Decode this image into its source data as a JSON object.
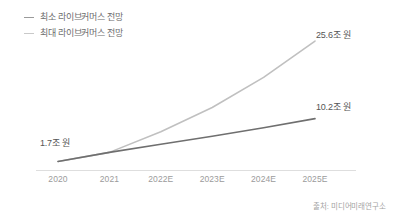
{
  "legend": {
    "position": "top-left",
    "items": [
      {
        "label": "최소 라이브커머스 전망",
        "icon": "line-dash-icon",
        "color": "#9a9a9a"
      },
      {
        "label": "최대 라이브커머스 전망",
        "icon": "line-dash-icon",
        "color": "#c9c9c9"
      }
    ]
  },
  "annotations": {
    "start": "1.7조 원",
    "max_end": "25.6조 원",
    "min_end": "10.2조 원"
  },
  "source": "출처: 미디어미래연구소",
  "colors": {
    "min_line": "#6f6f6f",
    "max_line": "#c0c0c0",
    "axis": "#dedede",
    "tick_text": "#9b9b9b",
    "label_text": "#555555",
    "legend_text": "#6d6d6d",
    "source_text": "#a3a3a3",
    "background": "#ffffff"
  },
  "chart_data": {
    "type": "line",
    "title": "",
    "subtitle": "",
    "xlabel": "",
    "ylabel": "",
    "grid": false,
    "legend_position": "top-left",
    "categories": [
      "2020",
      "2021",
      "2022E",
      "2023E",
      "2024E",
      "2025E"
    ],
    "x": [
      2020,
      2021,
      2022,
      2023,
      2024,
      2025
    ],
    "ylim": [
      0,
      27
    ],
    "unit": "조 원",
    "series": [
      {
        "name": "최소 라이브커머스 전망",
        "color": "#6f6f6f",
        "values": [
          1.7,
          3.5,
          5.1,
          6.7,
          8.4,
          10.2
        ]
      },
      {
        "name": "최대 라이브커머스 전망",
        "color": "#c0c0c0",
        "values": [
          1.7,
          3.5,
          7.6,
          12.4,
          18.4,
          25.6
        ]
      }
    ],
    "point_labels": [
      {
        "series": "both",
        "category": "2020",
        "text": "1.7조 원"
      },
      {
        "series": "최대 라이브커머스 전망",
        "category": "2025E",
        "text": "25.6조 원"
      },
      {
        "series": "최소 라이브커머스 전망",
        "category": "2025E",
        "text": "10.2조 원"
      }
    ]
  }
}
